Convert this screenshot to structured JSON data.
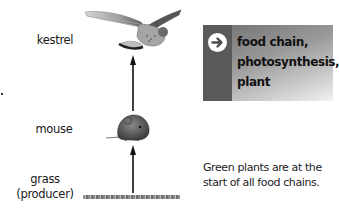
{
  "diagram": {
    "type": "food-chain",
    "levels": [
      {
        "label": "kestrel",
        "image": "kestrel-bird"
      },
      {
        "label": "mouse",
        "image": "mouse"
      },
      {
        "label": "grass",
        "sublabel": "(producer)",
        "image": "grass-strip"
      }
    ],
    "arrows": [
      {
        "from": "grass",
        "to": "mouse"
      },
      {
        "from": "mouse",
        "to": "kestrel"
      }
    ]
  },
  "keywords": {
    "icon": "arrow-right-circle-icon",
    "terms": [
      "food chain,",
      "photosynthesis,",
      "plant"
    ]
  },
  "caption": {
    "line1": "Green plants are at the",
    "line2": "start of all food chains."
  },
  "colors": {
    "box_strip": "#5a5a5a",
    "box_gradient_start": "#6f6f6f",
    "box_gradient_end": "#f2f2f2",
    "text": "#1a1a1a"
  }
}
